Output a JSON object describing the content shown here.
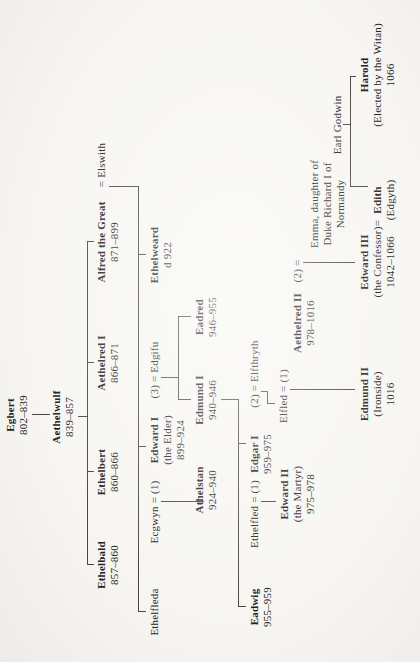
{
  "page": {
    "background": "#f7f6f2",
    "ink_color": "#23211d",
    "rule_color": "#4a473f",
    "orientation": "rotated-90-ccw"
  },
  "tree": {
    "people": [
      {
        "id": "egbert",
        "lines": [
          "Egbert",
          "802–839"
        ],
        "bold": 1,
        "x": 247,
        "y": 4
      },
      {
        "id": "aethelwulf",
        "lines": [
          "Aethelwulf",
          "839–857"
        ],
        "bold": 1,
        "x": 245,
        "y": 50
      },
      {
        "id": "ethelbald",
        "lines": [
          "Ethelbald",
          "857–860"
        ],
        "bold": 1,
        "x": 97,
        "y": 95
      },
      {
        "id": "ethelbert",
        "lines": [
          "Ethelbert",
          "860–866"
        ],
        "bold": 1,
        "x": 190,
        "y": 95
      },
      {
        "id": "aethelred-1",
        "lines": [
          "Aethelred I",
          "866–871"
        ],
        "bold": 1,
        "x": 299,
        "y": 95
      },
      {
        "id": "alfred",
        "lines": [
          "Alfred the Great",
          "871–899"
        ],
        "bold": 1,
        "x": 420,
        "y": 95
      },
      {
        "id": "elswith",
        "lines": [
          "= Elswith"
        ],
        "bold": 0,
        "x": 497,
        "y": 95
      },
      {
        "id": "ethelfleda",
        "lines": [
          "Ethelfleda"
        ],
        "bold": 0,
        "x": 50,
        "y": 148
      },
      {
        "id": "ecgwyn",
        "lines": [
          "Ecgwyn = (1)"
        ],
        "bold": 0,
        "x": 150,
        "y": 148
      },
      {
        "id": "edward-1",
        "lines": [
          "Edward I",
          "(the Elder)",
          "899–924"
        ],
        "bold": 1,
        "x": 222,
        "y": 148
      },
      {
        "id": "edgifu",
        "lines": [
          "(3) = Edgifu"
        ],
        "bold": 0,
        "x": 292,
        "y": 148
      },
      {
        "id": "ethelweard",
        "lines": [
          "Ethelweard",
          "d 922"
        ],
        "bold": 1,
        "x": 407,
        "y": 148
      },
      {
        "id": "athelstan",
        "lines": [
          "Athelstan",
          "924–940"
        ],
        "bold": 1,
        "x": 172,
        "y": 193
      },
      {
        "id": "edmund-1",
        "lines": [
          "Edmund I",
          "940–946"
        ],
        "bold": 1,
        "x": 262,
        "y": 193
      },
      {
        "id": "eadred",
        "lines": [
          "Eadred",
          "946–955"
        ],
        "bold": 1,
        "x": 345,
        "y": 193
      },
      {
        "id": "eadwig",
        "lines": [
          "Eadwig",
          "955–959"
        ],
        "bold": 1,
        "x": 55,
        "y": 248
      },
      {
        "id": "ethelfled",
        "lines": [
          "Ethelfled = (1)"
        ],
        "bold": 0,
        "x": 148,
        "y": 248
      },
      {
        "id": "edgar-1",
        "lines": [
          "Edgar I",
          "959–975"
        ],
        "bold": 1,
        "x": 208,
        "y": 248
      },
      {
        "id": "elfthryth",
        "lines": [
          "(2) = Elfthryth"
        ],
        "bold": 0,
        "x": 288,
        "y": 248
      },
      {
        "id": "edward-2",
        "lines": [
          "Edward II",
          "(the Martyr)",
          "975–978"
        ],
        "bold": 1,
        "x": 168,
        "y": 278
      },
      {
        "id": "elfled",
        "lines": [
          "Elfled = (1)"
        ],
        "bold": 0,
        "x": 266,
        "y": 277
      },
      {
        "id": "aethelred-2",
        "lines": [
          "Aethelred II",
          "978–1016"
        ],
        "bold": 1,
        "x": 339,
        "y": 291
      },
      {
        "id": "emma-equals",
        "lines": [
          "(2) ="
        ],
        "bold": 0,
        "x": 391,
        "y": 291
      },
      {
        "id": "emma",
        "lines": [
          "Emma, daughter of",
          "Duke Richard I of",
          "Normandy"
        ],
        "bold": 0,
        "x": 458,
        "y": 308
      },
      {
        "id": "edmund-2",
        "lines": [
          "Edmund II",
          "(Ironside)",
          "1016"
        ],
        "bold": 1,
        "x": 268,
        "y": 358
      },
      {
        "id": "edward-3",
        "lines": [
          "Edward III",
          "(the Confessor)",
          "1042–1066"
        ],
        "bold": 1,
        "x": 400,
        "y": 358
      },
      {
        "id": "edith-equals",
        "lines": [
          "="
        ],
        "bold": 0,
        "x": 439,
        "y": 371
      },
      {
        "id": "edith",
        "lines": [
          "Edith",
          "(Edgyth)"
        ],
        "bold": 1,
        "x": 462,
        "y": 371
      },
      {
        "id": "earl-godwin",
        "lines": [
          "Earl Godwin"
        ],
        "bold": 0,
        "x": 537,
        "y": 331
      },
      {
        "id": "harold",
        "lines": [
          "Harold",
          "(Elected by the Witan)",
          "1066"
        ],
        "bold": 1,
        "x": 587,
        "y": 358
      }
    ],
    "connectors": [
      {
        "o": "v",
        "x": 247,
        "y1": 32,
        "y2": 50
      },
      {
        "o": "v",
        "x": 245,
        "y1": 78,
        "y2": 87
      },
      {
        "o": "h",
        "y": 87,
        "x1": 97,
        "x2": 420
      },
      {
        "o": "v",
        "x": 97,
        "y1": 87,
        "y2": 94
      },
      {
        "o": "v",
        "x": 190,
        "y1": 87,
        "y2": 94
      },
      {
        "o": "v",
        "x": 299,
        "y1": 87,
        "y2": 94
      },
      {
        "o": "v",
        "x": 420,
        "y1": 87,
        "y2": 94
      },
      {
        "o": "v",
        "x": 475,
        "y1": 109,
        "y2": 138
      },
      {
        "o": "h",
        "y": 138,
        "x1": 50,
        "x2": 475
      },
      {
        "o": "v",
        "x": 50,
        "y1": 138,
        "y2": 146
      },
      {
        "o": "v",
        "x": 215,
        "y1": 138,
        "y2": 146
      },
      {
        "o": "v",
        "x": 407,
        "y1": 138,
        "y2": 146
      },
      {
        "o": "v",
        "x": 160,
        "y1": 161,
        "y2": 204
      },
      {
        "o": "v",
        "x": 284,
        "y1": 161,
        "y2": 178
      },
      {
        "o": "h",
        "y": 178,
        "x1": 262,
        "x2": 345
      },
      {
        "o": "v",
        "x": 262,
        "y1": 178,
        "y2": 191
      },
      {
        "o": "v",
        "x": 345,
        "y1": 178,
        "y2": 191
      },
      {
        "o": "v",
        "x": 262,
        "y1": 221,
        "y2": 238
      },
      {
        "o": "h",
        "y": 238,
        "x1": 55,
        "x2": 262
      },
      {
        "o": "v",
        "x": 55,
        "y1": 238,
        "y2": 246
      },
      {
        "o": "v",
        "x": 218,
        "y1": 238,
        "y2": 246
      },
      {
        "o": "v",
        "x": 160,
        "y1": 261,
        "y2": 276
      },
      {
        "o": "v",
        "x": 270,
        "y1": 261,
        "y2": 267
      },
      {
        "o": "h",
        "y": 267,
        "x1": 258,
        "x2": 270
      },
      {
        "o": "v",
        "x": 258,
        "y1": 267,
        "y2": 275
      },
      {
        "o": "v",
        "x": 272,
        "y1": 290,
        "y2": 355
      },
      {
        "o": "v",
        "x": 399,
        "y1": 303,
        "y2": 355
      },
      {
        "o": "v",
        "x": 537,
        "y1": 343,
        "y2": 350
      },
      {
        "o": "h",
        "y": 350,
        "x1": 475,
        "x2": 585
      },
      {
        "o": "v",
        "x": 475,
        "y1": 350,
        "y2": 368
      },
      {
        "o": "v",
        "x": 585,
        "y1": 350,
        "y2": 356
      }
    ]
  }
}
